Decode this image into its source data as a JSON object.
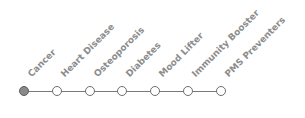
{
  "timeline": {
    "nodes": [
      {
        "label": "Cancer",
        "active": true
      },
      {
        "label": "Heart Disease",
        "active": false
      },
      {
        "label": "Osteoporosis",
        "active": false
      },
      {
        "label": "Diabetes",
        "active": false
      },
      {
        "label": "Mood Lifter",
        "active": false
      },
      {
        "label": "Immunity Booster",
        "active": false
      },
      {
        "label": "PMS Preventers",
        "active": false
      }
    ],
    "colors": {
      "line": "#7a7a7a",
      "active_fill": "#8a8a8a",
      "label": "#8c8c8c"
    }
  }
}
